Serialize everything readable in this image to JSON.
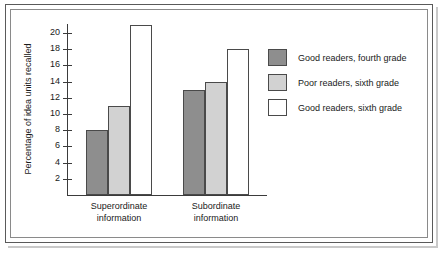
{
  "chart_data": {
    "type": "bar",
    "title": "",
    "xlabel": "",
    "ylabel": "Percentage of idea units recalled",
    "ylim": [
      0,
      21.5
    ],
    "yticks": [
      2,
      4,
      6,
      8,
      10,
      12,
      14,
      16,
      18,
      20
    ],
    "ytick_labels": [
      "2",
      "4",
      "6",
      "8",
      "10",
      "12",
      "14",
      "16",
      "18",
      "20"
    ],
    "grid": false,
    "legend_position": "right",
    "categories": [
      "Superordinate information",
      "Subordinate information"
    ],
    "category_lines": [
      [
        "Superordinate",
        "information"
      ],
      [
        "Subordinate",
        "information"
      ]
    ],
    "series": [
      {
        "name": "Good readers, fourth grade",
        "color": "#8e8e8e",
        "values": [
          8,
          13
        ]
      },
      {
        "name": "Poor readers, sixth grade",
        "color": "#d2d2d2",
        "values": [
          11,
          14
        ]
      },
      {
        "name": "Good readers, sixth grade",
        "color": "#ffffff",
        "values": [
          21,
          18
        ]
      }
    ]
  },
  "legend": {
    "items": [
      {
        "label": "Good readers, fourth grade",
        "color": "#8e8e8e"
      },
      {
        "label": "Poor readers, sixth grade",
        "color": "#d2d2d2"
      },
      {
        "label": "Good readers, sixth grade",
        "color": "#ffffff"
      }
    ]
  },
  "colors": {
    "axis": "#3b3b3b",
    "bar_outline": "#4a4a4a",
    "frame_outer": "#5a5a5a",
    "frame_inner": "#8a8a8a",
    "background": "#ffffff",
    "text": "#1a1a1a"
  }
}
